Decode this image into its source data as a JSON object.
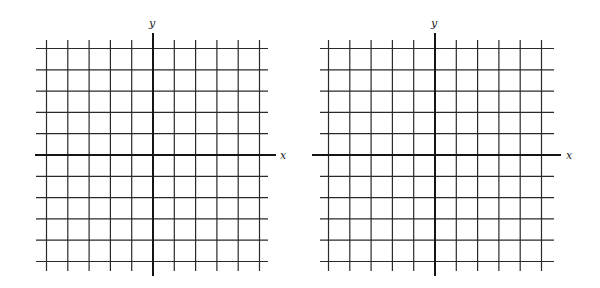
{
  "figure": {
    "panels": [
      {
        "id": "left-grid",
        "x_label": "x",
        "y_label": "y",
        "origin_px": [
          153,
          155
        ],
        "cell_px": 21.3,
        "units_left": 5,
        "units_right": 5,
        "units_up": 5,
        "units_down": 5,
        "grid_extent_px": {
          "left": 36,
          "right": 268,
          "top": 40,
          "bottom": 271
        },
        "axis_extent_px": {
          "x_from": 35,
          "x_to": 276,
          "y_from": 33,
          "y_to": 276
        },
        "x_label_pos_px": [
          280,
          150
        ],
        "y_label_pos_px": [
          149,
          18
        ]
      },
      {
        "id": "right-grid",
        "x_label": "x",
        "y_label": "y",
        "origin_px": [
          435,
          155
        ],
        "cell_px": 21.3,
        "units_left": 5,
        "units_right": 5,
        "units_up": 5,
        "units_down": 5,
        "grid_extent_px": {
          "left": 320,
          "right": 554,
          "top": 40,
          "bottom": 271
        },
        "axis_extent_px": {
          "x_from": 312,
          "x_to": 561,
          "y_from": 33,
          "y_to": 276
        },
        "x_label_pos_px": [
          566,
          150
        ],
        "y_label_pos_px": [
          431,
          18
        ]
      }
    ],
    "colors": {
      "line": "#2a2a2a",
      "axis": "#151515",
      "background": "#ffffff"
    }
  }
}
